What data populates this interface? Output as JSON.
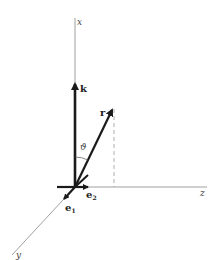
{
  "diagram": {
    "type": "3d-coordinate-vectors",
    "axes": {
      "x": {
        "label": "x",
        "direction": "up"
      },
      "y": {
        "label": "y",
        "direction": "down-left"
      },
      "z": {
        "label": "z",
        "direction": "right"
      }
    },
    "vectors": {
      "k": {
        "label": "k",
        "along": "x-axis"
      },
      "r": {
        "label": "r"
      },
      "e1": {
        "label": "e",
        "subscript": "1",
        "along": "y-axis"
      },
      "e2": {
        "label": "e",
        "subscript": "2",
        "along": "z-axis"
      }
    },
    "angle": {
      "label": "ϑ",
      "between": [
        "k",
        "r"
      ]
    },
    "projection": {
      "style": "dashed",
      "from": "tip of r",
      "to": "z-axis"
    },
    "colors": {
      "axis": "#888888",
      "vector": "#1a1a1a",
      "dashed": "#999999"
    }
  }
}
